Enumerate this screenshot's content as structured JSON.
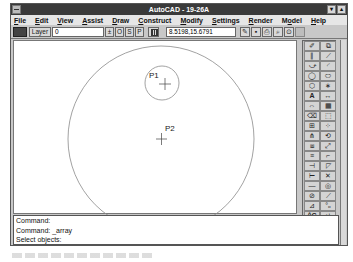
{
  "window": {
    "title": "AutoCAD - 19-26A",
    "buttons": {
      "minimize": "▾",
      "maximize": "▴"
    }
  },
  "menubar": {
    "items": [
      {
        "label": "File",
        "mnemonic": "F"
      },
      {
        "label": "Edit",
        "mnemonic": "E"
      },
      {
        "label": "View",
        "mnemonic": "V"
      },
      {
        "label": "Assist",
        "mnemonic": "A"
      },
      {
        "label": "Draw",
        "mnemonic": "D"
      },
      {
        "label": "Construct",
        "mnemonic": "C"
      },
      {
        "label": "Modify",
        "mnemonic": "M"
      },
      {
        "label": "Settings",
        "mnemonic": "S"
      },
      {
        "label": "Render",
        "mnemonic": "R"
      },
      {
        "label": "Model",
        "mnemonic": "o"
      },
      {
        "label": "Help",
        "mnemonic": "H"
      }
    ]
  },
  "toolbar": {
    "layer_button": "Layer",
    "layer_value": "0",
    "layer_dropdown": "±",
    "ortho": "O",
    "snap": "S",
    "paper": "P",
    "coordinates": "8.5198,15.6791",
    "icons": [
      {
        "name": "open-icon",
        "glyph": "✎"
      },
      {
        "name": "save-icon",
        "glyph": "▪"
      },
      {
        "name": "print-icon",
        "glyph": "⎙"
      },
      {
        "name": "zoom-window-icon",
        "glyph": "⌕"
      },
      {
        "name": "redraw-icon",
        "glyph": "⊙"
      }
    ]
  },
  "drawing": {
    "points": [
      {
        "label": "P1",
        "x": 150,
        "y": 43
      },
      {
        "label": "P2",
        "x": 147,
        "y": 98
      }
    ],
    "big_circle": {
      "cx": 147,
      "cy": 98,
      "r": 93
    },
    "small_circle": {
      "cx": 148,
      "cy": 42,
      "r": 17
    }
  },
  "toolbox": {
    "tools": [
      {
        "name": "pencil-tool",
        "glyph": "✐"
      },
      {
        "name": "select-window-tool",
        "glyph": "⧉"
      },
      {
        "name": "parallel-lines-tool",
        "glyph": "∥"
      },
      {
        "name": "line-tool",
        "glyph": "⟋"
      },
      {
        "name": "polyline-tool",
        "glyph": "⤻"
      },
      {
        "name": "arc-tool",
        "glyph": "◜"
      },
      {
        "name": "circle-tool",
        "glyph": "◯"
      },
      {
        "name": "ellipse-tool",
        "glyph": "⬭"
      },
      {
        "name": "polygon-tool",
        "glyph": "⬡"
      },
      {
        "name": "point-tool",
        "glyph": "∗"
      },
      {
        "name": "text-tool",
        "glyph": "A"
      },
      {
        "name": "dimension-tool",
        "glyph": "↔"
      },
      {
        "name": "stretch-tool",
        "glyph": "⇔"
      },
      {
        "name": "hatch-tool",
        "glyph": "▦"
      },
      {
        "name": "erase-tool",
        "glyph": "⌫"
      },
      {
        "name": "break-tool",
        "glyph": "⬚"
      },
      {
        "name": "move-tool",
        "glyph": "⊞"
      },
      {
        "name": "array-tool",
        "glyph": "⁘"
      },
      {
        "name": "mirror-tool",
        "glyph": "⋔"
      },
      {
        "name": "rotate-tool",
        "glyph": "⟲"
      },
      {
        "name": "copy-tool",
        "glyph": "⧈"
      },
      {
        "name": "scale-tool",
        "glyph": "⤢"
      },
      {
        "name": "offset-tool",
        "glyph": "≡"
      },
      {
        "name": "fillet-tool",
        "glyph": "⌐"
      },
      {
        "name": "trim-tool",
        "glyph": "⊣"
      },
      {
        "name": "chamfer-tool",
        "glyph": "◸"
      },
      {
        "name": "extend-tool",
        "glyph": "⊢"
      },
      {
        "name": "explode-tool",
        "glyph": "✕"
      },
      {
        "name": "divide-tool",
        "glyph": "—"
      },
      {
        "name": "donut-tool",
        "glyph": "◎"
      },
      {
        "name": "pedit-tool",
        "glyph": "⊘"
      },
      {
        "name": "measure-tool",
        "glyph": "⟋"
      },
      {
        "name": "elevation-tool",
        "glyph": "⊿"
      },
      {
        "name": "snap-tool",
        "glyph": "°ₒ"
      },
      {
        "name": "cancel-tool",
        "glyph": "^C"
      },
      {
        "name": "undo-tool",
        "glyph": "↵"
      }
    ]
  },
  "command": {
    "lines": [
      "Command:",
      "Command: _array",
      "Select objects:"
    ]
  }
}
